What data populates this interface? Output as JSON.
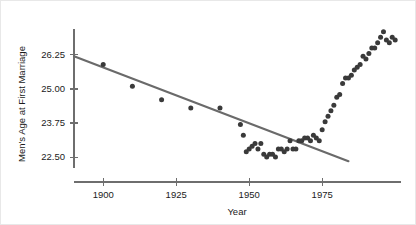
{
  "chart_data": {
    "type": "scatter",
    "title": "",
    "subtitle": "",
    "xlabel": "Year",
    "ylabel": "Men's Age at First Marriage",
    "xlim": [
      1890,
      2002
    ],
    "ylim": [
      22.1,
      27.2
    ],
    "xticks": [
      1900,
      1925,
      1950,
      1975
    ],
    "xtick_labels": [
      "1900",
      "1925",
      "1950",
      "1975"
    ],
    "yticks": [
      22.5,
      23.75,
      25.0,
      26.25
    ],
    "ytick_labels": [
      "22.50",
      "23.75",
      "25.00",
      "26.25"
    ],
    "grid": false,
    "legend": null,
    "point_color": "#3a3a3a",
    "line_color": "#6a6a6a",
    "axis_color": "#6e6e6e",
    "text_color": "#1b1b1b",
    "series": [
      {
        "name": "Men's median age at first marriage",
        "marker": "circle",
        "x": [
          1900,
          1910,
          1920,
          1930,
          1940,
          1947,
          1948,
          1949,
          1950,
          1951,
          1952,
          1953,
          1954,
          1955,
          1956,
          1957,
          1958,
          1959,
          1960,
          1961,
          1962,
          1963,
          1964,
          1965,
          1966,
          1967,
          1968,
          1969,
          1970,
          1971,
          1972,
          1973,
          1974,
          1975,
          1976,
          1977,
          1978,
          1979,
          1980,
          1981,
          1982,
          1983,
          1984,
          1985,
          1986,
          1987,
          1988,
          1989,
          1990,
          1991,
          1992,
          1993,
          1994,
          1995,
          1996,
          1997,
          1998,
          1999,
          2000
        ],
        "y": [
          25.9,
          25.1,
          24.6,
          24.3,
          24.3,
          23.7,
          23.3,
          22.7,
          22.8,
          22.9,
          23.0,
          22.8,
          23.0,
          22.6,
          22.5,
          22.6,
          22.6,
          22.5,
          22.8,
          22.8,
          22.7,
          22.8,
          23.1,
          22.8,
          22.8,
          23.1,
          23.1,
          23.2,
          23.2,
          23.1,
          23.3,
          23.2,
          23.1,
          23.5,
          23.8,
          24.0,
          24.2,
          24.4,
          24.7,
          24.8,
          25.2,
          25.4,
          25.4,
          25.5,
          25.7,
          25.8,
          25.9,
          26.2,
          26.1,
          26.3,
          26.5,
          26.5,
          26.7,
          26.9,
          27.1,
          26.8,
          26.7,
          26.9,
          26.8
        ]
      }
    ],
    "trend_line": {
      "name": "linear regression fit",
      "x_start": 1890,
      "y_start": 26.2,
      "x_end": 1984,
      "y_end": 22.35,
      "color": "#6a6a6a"
    }
  },
  "axes": {
    "x_axis_label": "Year",
    "y_axis_label": "Men's Age at First Marriage"
  }
}
